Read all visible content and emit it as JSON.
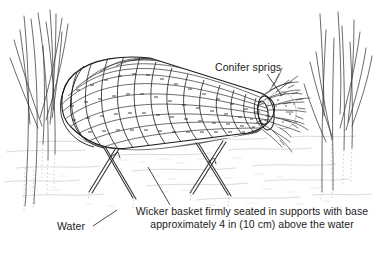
{
  "figure": {
    "background_color": "#ffffff",
    "ink_color": "#1b1b1b",
    "water_tone": "#c8c8c8"
  },
  "labels": {
    "conifer_sprigs": "Conifer sprigs",
    "water": "Water"
  },
  "caption": {
    "line1": "Wicker basket firmly seated in supports with base",
    "line2": "approximately 4 in (10 cm) above the water"
  },
  "measurements": {
    "clearance_imperial": "4 in",
    "clearance_metric": "10 cm"
  },
  "scene_elements": {
    "basket": "wicker-basket",
    "sprigs": "conifer-sprigs",
    "supports": "crossed-support-sticks",
    "water_surface": "water-ripples",
    "vegetation_left": "reeds-left",
    "vegetation_right": "reeds-right"
  }
}
